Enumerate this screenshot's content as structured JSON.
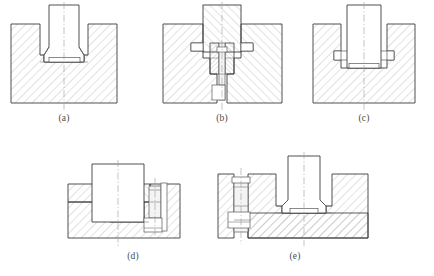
{
  "figure": {
    "background_color": "#ffffff",
    "line_color": "#3c3c3c",
    "hatch_color": "#8d8d8d",
    "centerline_color": "#9a9a9a",
    "caption_color": "#4a4a4a",
    "panel_count": 5
  },
  "captions": {
    "a": "(a)",
    "b": "(b)",
    "c": "(c)",
    "d": "(d)",
    "e": "(e)"
  },
  "panels": [
    {
      "id": "a",
      "caption": "(a)",
      "description": "Vertical section: plain boss seated in hatched housing with shallow recess, vertical centerline",
      "centerline": "vertical",
      "hatched_regions": 1,
      "fasteners": 0
    },
    {
      "id": "b",
      "caption": "(b)",
      "description": "Vertical section: hatched boss clamped by central bolt through housing, side flanges, vertical centerline",
      "centerline": "vertical",
      "hatched_regions": 3,
      "fasteners": 1
    },
    {
      "id": "c",
      "caption": "(c)",
      "description": "Vertical section: plain boss with small side keys engaging hatched housing, vertical centerline",
      "centerline": "vertical",
      "hatched_regions": 1,
      "fasteners": 0
    },
    {
      "id": "d",
      "caption": "(d)",
      "description": "Vertical section: wide housing with horizontal side bolt at right, stepped cavity, vertical centerline",
      "centerline": "vertical",
      "hatched_regions": 2,
      "fasteners": 1
    },
    {
      "id": "e",
      "caption": "(e)",
      "description": "Vertical section: broad housing with central boss and vertical bolt at left side, two centerlines",
      "centerline": "vertical",
      "hatched_regions": 3,
      "fasteners": 1
    }
  ]
}
